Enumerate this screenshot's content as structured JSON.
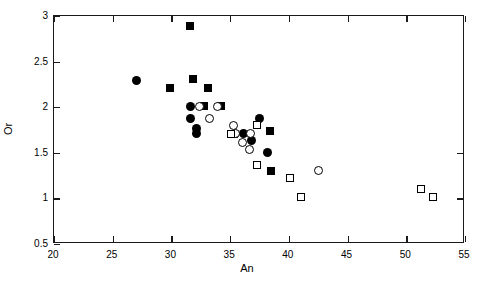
{
  "chart_data": {
    "type": "scatter",
    "title": "",
    "xlabel": "An",
    "ylabel": "Or",
    "xlim": [
      20,
      55
    ],
    "ylim": [
      0.5,
      3
    ],
    "grid": false,
    "legend": "none",
    "xticks": [
      20,
      25,
      30,
      35,
      40,
      45,
      50,
      55
    ],
    "xtick_labels": [
      "20",
      "25",
      "30",
      "35",
      "40",
      "45",
      "50",
      "55"
    ],
    "yticks": [
      0.5,
      1,
      1.5,
      2,
      2.5,
      3
    ],
    "ytick_labels": [
      "0.5",
      "1",
      "1.5",
      "2",
      "2.5",
      "3"
    ],
    "series": [
      {
        "name": "filled-square",
        "marker": "filled-square",
        "points": [
          [
            31.7,
            2.88
          ],
          [
            31.9,
            2.3
          ],
          [
            30.0,
            2.2
          ],
          [
            33.2,
            2.2
          ],
          [
            32.9,
            2.0
          ],
          [
            34.3,
            2.0
          ],
          [
            35.4,
            1.7
          ],
          [
            38.5,
            1.73
          ],
          [
            38.6,
            1.29
          ]
        ]
      },
      {
        "name": "filled-circle",
        "marker": "filled-circle",
        "points": [
          [
            27.1,
            2.28
          ],
          [
            31.7,
            2.0
          ],
          [
            31.7,
            1.86
          ],
          [
            32.2,
            1.76
          ],
          [
            32.2,
            1.7
          ],
          [
            36.2,
            1.7
          ],
          [
            36.9,
            1.62
          ],
          [
            37.6,
            1.86
          ],
          [
            38.3,
            1.49
          ]
        ]
      },
      {
        "name": "open-circle",
        "marker": "open-circle",
        "points": [
          [
            32.5,
            2.0
          ],
          [
            34.0,
            2.0
          ],
          [
            33.3,
            1.86
          ],
          [
            35.4,
            1.79
          ],
          [
            35.5,
            1.7
          ],
          [
            36.8,
            1.7
          ],
          [
            36.1,
            1.6
          ],
          [
            36.7,
            1.52
          ],
          [
            42.6,
            1.3
          ]
        ]
      },
      {
        "name": "open-square",
        "marker": "open-square",
        "points": [
          [
            35.2,
            1.7
          ],
          [
            37.4,
            1.79
          ],
          [
            37.4,
            1.36
          ],
          [
            40.2,
            1.21
          ],
          [
            41.1,
            1.0
          ],
          [
            51.3,
            1.09
          ],
          [
            52.4,
            1.0
          ]
        ]
      }
    ]
  }
}
